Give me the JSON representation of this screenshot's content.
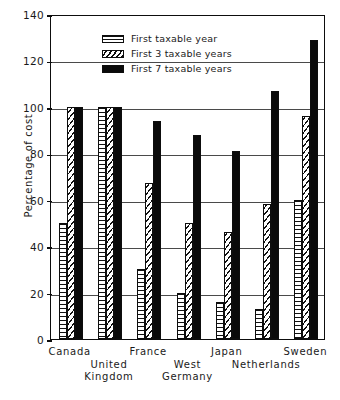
{
  "chart_data": {
    "type": "bar",
    "title": "",
    "xlabel": "",
    "ylabel": "Percentage of cost",
    "ylim": [
      0,
      140
    ],
    "yticks": [
      0,
      20,
      40,
      60,
      80,
      100,
      120,
      140
    ],
    "grid": true,
    "legend_position": "top-center",
    "categories": [
      "Canada",
      "United\nKingdom",
      "France",
      "West\nGermany",
      "Japan",
      "Netherlands",
      "Sweden"
    ],
    "series": [
      {
        "name": "First taxable year",
        "pattern": "horizontal-stripes",
        "values": [
          50,
          100,
          30,
          20,
          16,
          13,
          60
        ]
      },
      {
        "name": "First 3 taxable years",
        "pattern": "diagonal-hatch",
        "values": [
          100,
          100,
          67,
          50,
          46,
          58,
          96
        ]
      },
      {
        "name": "First 7 taxable years",
        "pattern": "solid-black",
        "values": [
          100,
          100,
          94,
          88,
          81,
          107,
          129
        ]
      }
    ]
  },
  "axis": {
    "y_title": "Percentage of cost",
    "y_tick_labels": [
      "140",
      "120",
      "100",
      "80",
      "60",
      "40",
      "20",
      "0"
    ]
  },
  "legend": {
    "items": [
      {
        "label": "First taxable year"
      },
      {
        "label": "First 3 taxable years"
      },
      {
        "label": "First 7 taxable years"
      }
    ]
  },
  "colors": {
    "axis": "#0d0d0d",
    "gridline": "#4a4a4a",
    "bar_solid": "#0a0a0a",
    "background": "#ffffff"
  }
}
